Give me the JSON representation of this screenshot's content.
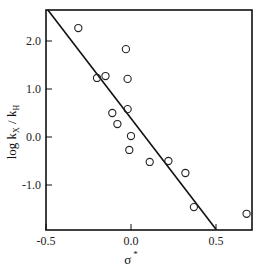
{
  "chart_data": {
    "type": "scatter",
    "title": "",
    "xlabel": "σ*",
    "ylabel": "log kX / kH",
    "xlim": [
      -0.5,
      0.71
    ],
    "ylim": [
      -1.94,
      2.65
    ],
    "x_ticks": [
      -0.5,
      0.0,
      0.5
    ],
    "x_tick_labels": [
      "-0.5",
      "0.0",
      "0.5"
    ],
    "y_ticks": [
      2.0,
      1.0,
      0.0,
      -1.0
    ],
    "y_tick_labels": [
      "2.0",
      "1.0",
      "0.0",
      "-1.0"
    ],
    "grid": false,
    "legend": null,
    "series": [
      {
        "name": "data",
        "marker": "open-circle",
        "points": [
          {
            "x": -0.31,
            "y": 2.27
          },
          {
            "x": -0.2,
            "y": 1.23
          },
          {
            "x": -0.15,
            "y": 1.27
          },
          {
            "x": -0.03,
            "y": 1.83
          },
          {
            "x": -0.02,
            "y": 1.21
          },
          {
            "x": -0.02,
            "y": 0.58
          },
          {
            "x": -0.11,
            "y": 0.5
          },
          {
            "x": -0.08,
            "y": 0.27
          },
          {
            "x": 0.0,
            "y": 0.02
          },
          {
            "x": -0.01,
            "y": -0.27
          },
          {
            "x": 0.11,
            "y": -0.52
          },
          {
            "x": 0.22,
            "y": -0.5
          },
          {
            "x": 0.32,
            "y": -0.75
          },
          {
            "x": 0.37,
            "y": -1.46
          },
          {
            "x": 0.68,
            "y": -1.6
          }
        ]
      },
      {
        "name": "fit",
        "type": "line",
        "points": [
          {
            "x": -0.49,
            "y": 2.65
          },
          {
            "x": 0.5,
            "y": -1.92
          }
        ]
      }
    ]
  },
  "labels": {
    "ylabel_main": "log k",
    "ylabel_sub1": "X",
    "ylabel_sep": " / k",
    "ylabel_sub2": "H",
    "xlabel_main": "σ",
    "xlabel_sup": "*"
  }
}
